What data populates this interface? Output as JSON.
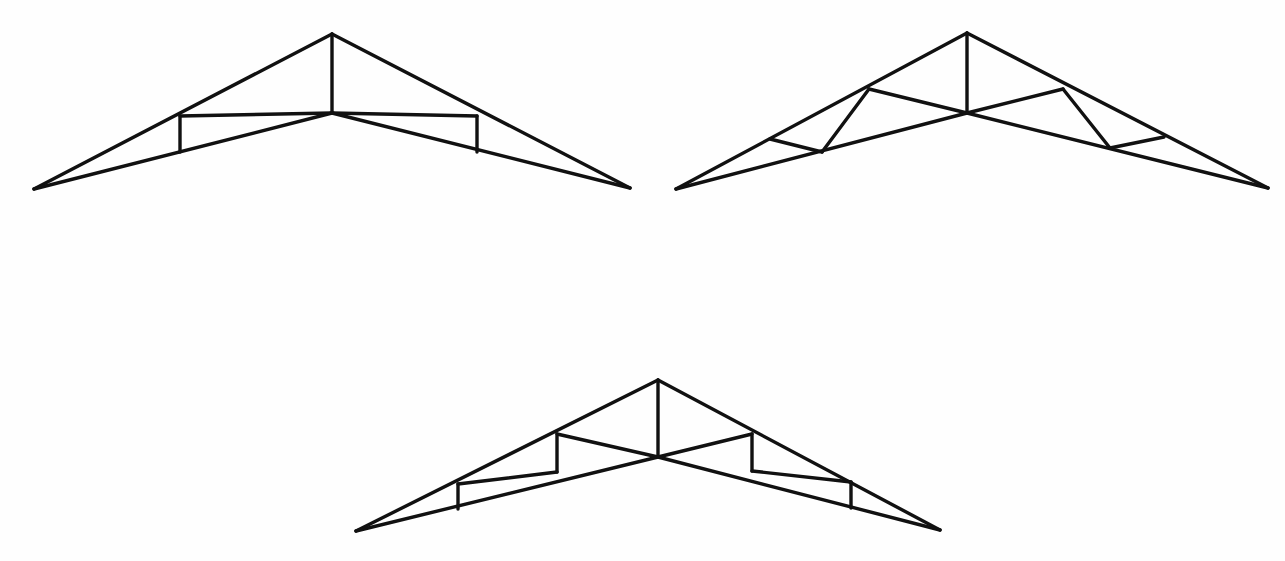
{
  "figure": {
    "background_color": "#fefefe",
    "line_color": "#111111",
    "canvas": {
      "width": 1285,
      "height": 561
    }
  },
  "trusses": [
    {
      "id": "truss-1",
      "name": "king-post-truss-with-raised-tie",
      "label": "",
      "apex": {
        "x": 332,
        "y": 34
      },
      "center_node": {
        "x": 332,
        "y": 113
      },
      "left_tip": {
        "x": 34,
        "y": 189
      },
      "right_tip": {
        "x": 630,
        "y": 188
      },
      "stroke_width": 3.4,
      "members": [
        {
          "name": "top-chord-left",
          "x1": 34,
          "y1": 189,
          "x2": 332,
          "y2": 34
        },
        {
          "name": "top-chord-right",
          "x1": 332,
          "y1": 34,
          "x2": 630,
          "y2": 188
        },
        {
          "name": "bottom-chord-left",
          "x1": 34,
          "y1": 189,
          "x2": 332,
          "y2": 113
        },
        {
          "name": "bottom-chord-right",
          "x1": 332,
          "y1": 113,
          "x2": 630,
          "y2": 188
        },
        {
          "name": "king-post",
          "x1": 332,
          "y1": 34,
          "x2": 332,
          "y2": 113
        },
        {
          "name": "tie-beam-left",
          "x1": 180,
          "y1": 116,
          "x2": 332,
          "y2": 113
        },
        {
          "name": "tie-beam-right",
          "x1": 332,
          "y1": 113,
          "x2": 477,
          "y2": 116
        },
        {
          "name": "strut-left-vertical",
          "x1": 180,
          "y1": 116,
          "x2": 180,
          "y2": 152
        },
        {
          "name": "strut-right-vertical",
          "x1": 477,
          "y1": 116,
          "x2": 477,
          "y2": 152
        }
      ]
    },
    {
      "id": "truss-2",
      "name": "truss-with-diagonal-web-bracing",
      "label": "",
      "apex": {
        "x": 967,
        "y": 33
      },
      "center_node": {
        "x": 967,
        "y": 113
      },
      "left_tip": {
        "x": 676,
        "y": 189
      },
      "right_tip": {
        "x": 1268,
        "y": 188
      },
      "stroke_width": 3.4,
      "members": [
        {
          "name": "top-chord-left",
          "x1": 676,
          "y1": 189,
          "x2": 967,
          "y2": 33
        },
        {
          "name": "top-chord-right",
          "x1": 967,
          "y1": 33,
          "x2": 1268,
          "y2": 188
        },
        {
          "name": "bottom-chord-left",
          "x1": 676,
          "y1": 189,
          "x2": 967,
          "y2": 113
        },
        {
          "name": "bottom-chord-right",
          "x1": 967,
          "y1": 113,
          "x2": 1268,
          "y2": 188
        },
        {
          "name": "king-post",
          "x1": 967,
          "y1": 33,
          "x2": 967,
          "y2": 113
        },
        {
          "name": "rafter-tie-left",
          "x1": 869,
          "y1": 89,
          "x2": 967,
          "y2": 113
        },
        {
          "name": "rafter-tie-right",
          "x1": 967,
          "y1": 113,
          "x2": 1063,
          "y2": 89
        },
        {
          "name": "diagonal-strut-left",
          "x1": 869,
          "y1": 89,
          "x2": 822,
          "y2": 152
        },
        {
          "name": "diagonal-strut-right",
          "x1": 1063,
          "y1": 89,
          "x2": 1110,
          "y2": 148
        },
        {
          "name": "short-tie-left",
          "x1": 770,
          "y1": 139,
          "x2": 822,
          "y2": 152
        },
        {
          "name": "short-tie-right",
          "x1": 1110,
          "y1": 148,
          "x2": 1164,
          "y2": 137
        }
      ]
    },
    {
      "id": "truss-3",
      "name": "two-panel-truss-with-double-posts",
      "label": "",
      "apex": {
        "x": 658,
        "y": 380
      },
      "center_node": {
        "x": 658,
        "y": 457
      },
      "left_tip": {
        "x": 356,
        "y": 531
      },
      "right_tip": {
        "x": 940,
        "y": 530
      },
      "stroke_width": 3.4,
      "members": [
        {
          "name": "top-chord-left",
          "x1": 356,
          "y1": 531,
          "x2": 658,
          "y2": 380
        },
        {
          "name": "top-chord-right",
          "x1": 658,
          "y1": 380,
          "x2": 940,
          "y2": 530
        },
        {
          "name": "bottom-chord-left",
          "x1": 356,
          "y1": 531,
          "x2": 658,
          "y2": 457
        },
        {
          "name": "bottom-chord-right",
          "x1": 658,
          "y1": 457,
          "x2": 940,
          "y2": 530
        },
        {
          "name": "king-post",
          "x1": 658,
          "y1": 380,
          "x2": 658,
          "y2": 457
        },
        {
          "name": "rafter-tie-left",
          "x1": 557,
          "y1": 434,
          "x2": 658,
          "y2": 457
        },
        {
          "name": "rafter-tie-right",
          "x1": 658,
          "y1": 457,
          "x2": 752,
          "y2": 434
        },
        {
          "name": "inner-post-left",
          "x1": 557,
          "y1": 434,
          "x2": 557,
          "y2": 472
        },
        {
          "name": "inner-post-right",
          "x1": 752,
          "y1": 434,
          "x2": 752,
          "y2": 471
        },
        {
          "name": "lower-tie-left",
          "x1": 458,
          "y1": 484,
          "x2": 557,
          "y2": 472
        },
        {
          "name": "lower-tie-right",
          "x1": 752,
          "y1": 471,
          "x2": 851,
          "y2": 482
        },
        {
          "name": "outer-post-left",
          "x1": 458,
          "y1": 484,
          "x2": 458,
          "y2": 509
        },
        {
          "name": "outer-post-right",
          "x1": 851,
          "y1": 482,
          "x2": 851,
          "y2": 508
        }
      ]
    }
  ]
}
